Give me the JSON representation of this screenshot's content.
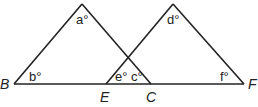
{
  "diagram": {
    "type": "two overlapping triangles on a common baseline",
    "points": {
      "B": {
        "label": "B",
        "x": 14,
        "y": 84
      },
      "E": {
        "label": "E",
        "x": 106,
        "y": 84
      },
      "C": {
        "label": "C",
        "x": 151,
        "y": 84
      },
      "F": {
        "label": "F",
        "x": 244,
        "y": 84
      },
      "A_apex": {
        "x": 82,
        "y": 4
      },
      "D_apex": {
        "x": 173,
        "y": 4
      }
    },
    "angles": {
      "a": "a°",
      "b": "b°",
      "c": "c°",
      "d": "d°",
      "e": "e°",
      "f": "f°"
    },
    "point_labels": {
      "B": "B",
      "E": "E",
      "C": "C",
      "F": "F"
    }
  }
}
